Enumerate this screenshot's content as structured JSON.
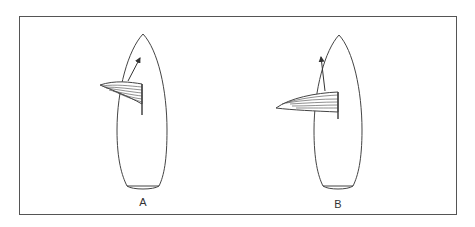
{
  "figure": {
    "type": "sailboat top-view comparison",
    "panels": [
      {
        "label": "A",
        "description": "Boat with sail set at wide angle, heading arrow to the right of bow"
      },
      {
        "label": "B",
        "description": "Boat with sail more eased, heading arrow to the left of bow"
      }
    ]
  },
  "colors": {
    "stroke": "#444444",
    "frame": "#555555",
    "background": "#ffffff"
  }
}
